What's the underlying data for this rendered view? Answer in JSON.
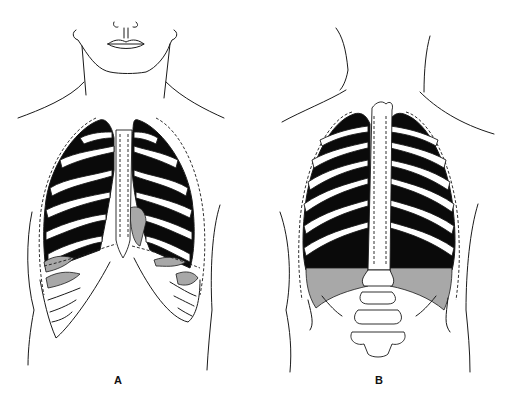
{
  "figure": {
    "panels": [
      {
        "id": "A",
        "label": "A",
        "view": "anterior view of chest with lungs, ribs and diaphragm"
      },
      {
        "id": "B",
        "label": "B",
        "view": "posterior view of back with lungs, ribs, spine and diaphragm"
      }
    ],
    "colors": {
      "line": "#1a1a1a",
      "lung": "#0a0a0a",
      "diaphragm": "#a8a8a8",
      "background": "#ffffff"
    }
  }
}
